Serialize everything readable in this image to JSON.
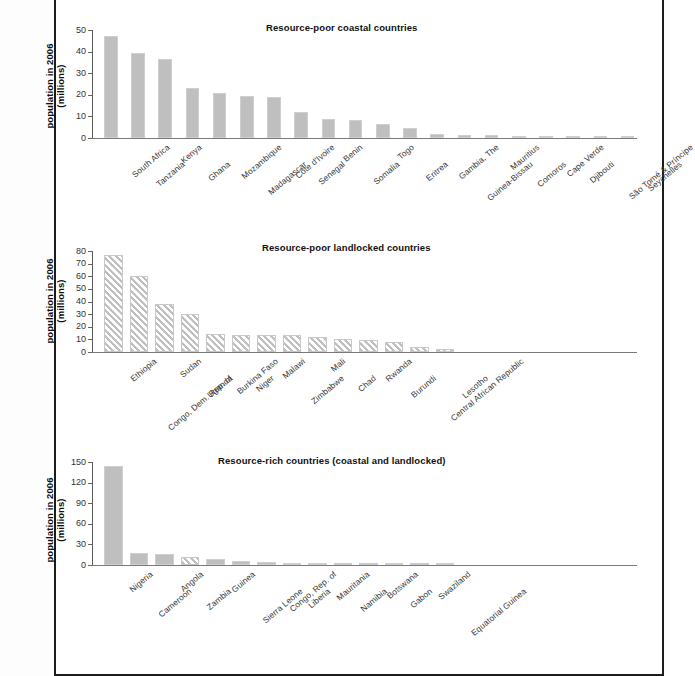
{
  "figure": {
    "ylabel_line1": "population in 2006",
    "ylabel_line2": "(millions)",
    "bar_color": "#bfbfbf",
    "frame_color": "#1c1c1c"
  },
  "chart_data": [
    {
      "type": "bar",
      "title": "Resource-poor coastal countries",
      "ylabel": "population in 2006 (millions)",
      "xlabel": "",
      "ylim": [
        0,
        50
      ],
      "yticks": [
        0,
        10,
        20,
        30,
        40,
        50
      ],
      "grid": false,
      "legend": "none",
      "categories": [
        "South Africa",
        "Tanzania",
        "Kenya",
        "Ghana",
        "Mozambique",
        "Madagascar",
        "Côte d'Ivoire",
        "Senegal",
        "Benin",
        "Somalia",
        "Togo",
        "Eritrea",
        "Gambia, The",
        "Guinea-Bissau",
        "Mauritius",
        "Comoros",
        "Cape Verde",
        "Djibouti",
        "São Tomé & Príncipe",
        "Seychelles"
      ],
      "values": [
        47.4,
        39.5,
        36.6,
        23.0,
        21.0,
        19.5,
        19.0,
        12.1,
        8.8,
        8.5,
        6.4,
        4.7,
        1.7,
        1.6,
        1.3,
        0.6,
        0.5,
        0.8,
        0.16,
        0.09
      ],
      "patterns": [
        "solid",
        "solid",
        "solid",
        "solid",
        "solid",
        "solid",
        "solid",
        "solid",
        "solid",
        "solid",
        "solid",
        "solid",
        "solid",
        "solid",
        "solid",
        "solid",
        "solid",
        "solid",
        "solid",
        "solid"
      ]
    },
    {
      "type": "bar",
      "title": "Resource-poor landlocked countries",
      "ylabel": "population in 2006 (millions)",
      "xlabel": "",
      "ylim": [
        0,
        80
      ],
      "yticks": [
        0,
        10,
        20,
        30,
        40,
        50,
        60,
        70,
        80
      ],
      "grid": false,
      "legend": "none",
      "categories": [
        "Ethiopia",
        "Congo, Dem. Rep. of",
        "Sudan",
        "Uganda",
        "Burkina Faso",
        "Niger",
        "Malawi",
        "Zimbabwe",
        "Mali",
        "Chad",
        "Rwanda",
        "Burundi",
        "Central African Republic",
        "Lesotho"
      ],
      "values": [
        77.0,
        60.6,
        37.7,
        29.9,
        14.4,
        13.7,
        13.2,
        13.1,
        11.9,
        10.5,
        9.5,
        7.8,
        4.3,
        2.0
      ],
      "patterns": [
        "hatch",
        "hatch",
        "hatch",
        "hatch",
        "hatch",
        "hatch",
        "hatch",
        "hatch",
        "hatch",
        "hatch",
        "hatch",
        "hatch",
        "hatch",
        "hatch"
      ]
    },
    {
      "type": "bar",
      "title": "Resource-rich countries (coastal and landlocked)",
      "ylabel": "population in 2006 (millions)",
      "xlabel": "",
      "ylim": [
        0,
        150
      ],
      "yticks": [
        0,
        30,
        60,
        90,
        120,
        150
      ],
      "grid": false,
      "legend": "none",
      "categories": [
        "Nigeria",
        "Cameroon",
        "Angola",
        "Zambia",
        "Guinea",
        "Sierra Leone",
        "Congo, Rep. of",
        "Liberia",
        "Mauritania",
        "Namibia",
        "Botswana",
        "Gabon",
        "Swaziland",
        "Equatorial Guinea"
      ],
      "values": [
        144.0,
        18.2,
        16.6,
        11.9,
        9.2,
        5.7,
        3.7,
        3.6,
        3.0,
        2.0,
        1.8,
        1.3,
        1.1,
        0.5
      ],
      "patterns": [
        "solid",
        "solid",
        "solid",
        "hatch",
        "solid",
        "solid",
        "solid",
        "solid",
        "solid",
        "hatch",
        "hatch",
        "solid",
        "hatch",
        "solid"
      ]
    }
  ]
}
